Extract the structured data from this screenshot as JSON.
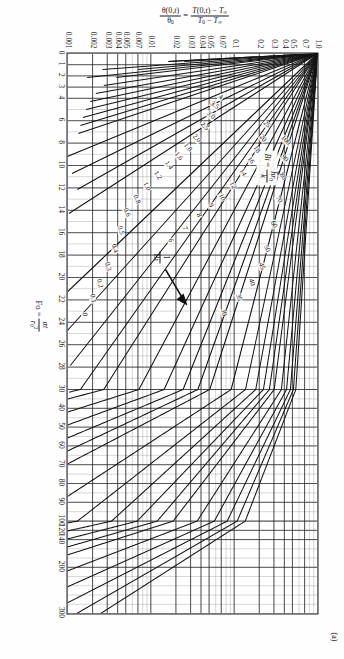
{
  "figure": {
    "panel_label": "(a)",
    "bi_legend": {
      "symbol": "Bi",
      "equals": "=",
      "num": "h r0",
      "den": "k"
    },
    "pointer_annotation": "1/Bi"
  },
  "axes": {
    "x": {
      "title_prefix": "Fo",
      "title_equals": "=",
      "title_num": "αt",
      "title_den": "r0 2",
      "ticks": [
        "0",
        "1",
        "2",
        "3",
        "4",
        "6",
        "8",
        "10",
        "12",
        "14",
        "16",
        "18",
        "20",
        "22",
        "24",
        "26",
        "28",
        "30",
        "40",
        "50",
        "60",
        "70",
        "80",
        "90",
        "100",
        "120",
        "140",
        "200",
        "300"
      ],
      "tick_values": [
        0,
        1,
        2,
        3,
        4,
        6,
        8,
        10,
        12,
        14,
        16,
        18,
        20,
        22,
        24,
        26,
        28,
        30,
        40,
        50,
        60,
        70,
        80,
        90,
        100,
        120,
        140,
        200,
        300
      ],
      "scale": "piecewise-linear",
      "range": [
        0,
        300
      ]
    },
    "y": {
      "title_left_num": "θ(0,t)",
      "title_left_den": "θ0",
      "title_equals": "=",
      "title_right_num": "T(0,t) − T∞",
      "title_right_den": "T0 − T∞",
      "ticks": [
        "1.0",
        "0.7",
        "0.5",
        "0.4",
        "0.3",
        "0.2",
        "0.1",
        "0.07",
        "0.05",
        "0.04",
        "0.03",
        "0.02",
        "0.01",
        "0.007",
        "0.005",
        "0.004",
        "0.003",
        "0.002",
        "0.001"
      ],
      "tick_values": [
        1.0,
        0.7,
        0.5,
        0.4,
        0.3,
        0.2,
        0.1,
        0.07,
        0.05,
        0.04,
        0.03,
        0.02,
        0.01,
        0.007,
        0.005,
        0.004,
        0.003,
        0.002,
        0.001
      ],
      "scale": "log",
      "range": [
        0.001,
        1.0
      ]
    }
  },
  "chart_data": {
    "type": "line",
    "xlabel": "Fo = αt / r0²",
    "ylabel": "θ(0,t)/θ0 = [T(0,t) − T∞]/[T0 − T∞]",
    "xlim": [
      0,
      300
    ],
    "ylim": [
      0.001,
      1.0
    ],
    "yscale": "log",
    "xscale": "piecewise-linear",
    "grid": true,
    "legend": "inline curve labels (values of 1/Bi)",
    "series_parameter": "1/Bi",
    "series": [
      {
        "name": "0",
        "label": "0",
        "label_x": 262,
        "label_y": 234,
        "label_rot": -9
      },
      {
        "name": "0.1",
        "label": "0.1",
        "label_x": 246,
        "label_y": 226,
        "label_rot": -11
      },
      {
        "name": "0.2",
        "label": "0.2",
        "label_x": 231,
        "label_y": 219,
        "label_rot": -13
      },
      {
        "name": "0.3",
        "label": "0.3",
        "label_x": 214,
        "label_y": 211,
        "label_rot": -15
      },
      {
        "name": "0.4",
        "label": "0.4",
        "label_x": 196,
        "label_y": 204,
        "label_rot": -17
      },
      {
        "name": "0.5",
        "label": "0.5",
        "label_x": 178,
        "label_y": 198,
        "label_rot": -19
      },
      {
        "name": "0.6",
        "label": "0.6",
        "label_x": 160,
        "label_y": 192,
        "label_rot": -21
      },
      {
        "name": "0.8",
        "label": "0.8",
        "label_x": 147,
        "label_y": 182,
        "label_rot": -24
      },
      {
        "name": "1.0",
        "label": "1.0",
        "label_x": 134,
        "label_y": 172,
        "label_rot": -27
      },
      {
        "name": "1.2",
        "label": "1.2",
        "label_x": 123,
        "label_y": 161,
        "label_rot": -31
      },
      {
        "name": "1.4",
        "label": "1.4",
        "label_x": 113,
        "label_y": 150,
        "label_rot": -35
      },
      {
        "name": "1.6",
        "label": "1.6",
        "label_x": 104,
        "label_y": 140,
        "label_rot": -38
      },
      {
        "name": "1.8",
        "label": "1.8",
        "label_x": 95,
        "label_y": 131,
        "label_rot": -41
      },
      {
        "name": "2.0",
        "label": "2.0",
        "label_x": 86,
        "label_y": 122,
        "label_rot": -44
      },
      {
        "name": "2.5",
        "label": "2.5",
        "label_x": 74,
        "label_y": 114,
        "label_rot": -47
      },
      {
        "name": "3.0",
        "label": "3.0",
        "label_x": 63,
        "label_y": 108,
        "label_rot": -50
      },
      {
        "name": "3.5",
        "label": "3.5",
        "label_x": 53,
        "label_y": 104,
        "label_rot": -53
      },
      {
        "name": "4",
        "label": "4",
        "label_x": 45,
        "label_y": 98,
        "label_rot": -55
      },
      {
        "name": "6",
        "label": "6",
        "label_x": 188,
        "label_y": 148,
        "label_rot": -16
      },
      {
        "name": "7",
        "label": "7",
        "label_x": 176,
        "label_y": 134,
        "label_rot": -18
      },
      {
        "name": "8",
        "label": "8",
        "label_x": 163,
        "label_y": 120,
        "label_rot": -20
      },
      {
        "name": "9",
        "label": "9",
        "label_x": 153,
        "label_y": 108,
        "label_rot": -22
      },
      {
        "name": "10",
        "label": "10",
        "label_x": 145,
        "label_y": 97,
        "label_rot": -24
      },
      {
        "name": "12",
        "label": "12",
        "label_x": 133,
        "label_y": 86,
        "label_rot": -27
      },
      {
        "name": "14",
        "label": "14",
        "label_x": 120,
        "label_y": 76,
        "label_rot": -30
      },
      {
        "name": "16",
        "label": "16",
        "label_x": 108,
        "label_y": 68,
        "label_rot": -33
      },
      {
        "name": "18",
        "label": "18",
        "label_x": 97,
        "label_y": 62,
        "label_rot": -36
      },
      {
        "name": "20",
        "label": "20",
        "label_x": 86,
        "label_y": 56,
        "label_rot": -39
      },
      {
        "name": "25",
        "label": "25",
        "label_x": 72,
        "label_y": 52,
        "label_rot": -44
      },
      {
        "name": "30",
        "label": "30",
        "label_x": 260,
        "label_y": 95,
        "label_rot": -17
      },
      {
        "name": "35",
        "label": "35",
        "label_x": 245,
        "label_y": 80,
        "label_rot": -19
      },
      {
        "name": "40",
        "label": "40",
        "label_x": 230,
        "label_y": 67,
        "label_rot": -21
      },
      {
        "name": "45",
        "label": "45",
        "label_x": 214,
        "label_y": 57,
        "label_rot": -23
      },
      {
        "name": "50",
        "label": "50",
        "label_x": 196,
        "label_y": 52,
        "label_rot": -25
      },
      {
        "name": "60",
        "label": "60",
        "label_x": 172,
        "label_y": 45,
        "label_rot": -29
      },
      {
        "name": "70",
        "label": "70",
        "label_x": 147,
        "label_y": 40,
        "label_rot": -33
      },
      {
        "name": "80",
        "label": "80",
        "label_x": 124,
        "label_y": 36,
        "label_rot": -37
      },
      {
        "name": "90",
        "label": "90",
        "label_x": 106,
        "label_y": 34,
        "label_rot": -41
      },
      {
        "name": "100",
        "label": "100",
        "label_x": 88,
        "label_y": 33,
        "label_rot": -45
      }
    ]
  }
}
